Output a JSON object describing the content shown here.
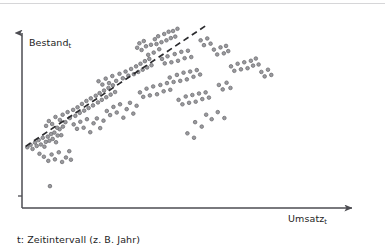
{
  "chart_data": {
    "type": "scatter",
    "title": "",
    "subtitle": "",
    "xlabel": "Umsatz",
    "xlabel_sub": "t",
    "ylabel": "Bestand",
    "ylabel_sub": "t",
    "caption": "t: Zeitintervall (z. B. Jahr)",
    "grid": false,
    "legend": "none",
    "axis_style": "arrow-axes-no-ticks",
    "xlim": [
      0,
      100
    ],
    "ylim": [
      0,
      100
    ],
    "x_tick_labels": [],
    "y_tick_labels": [],
    "marker": {
      "shape": "circle",
      "fill": "#9a9a9e",
      "stroke": "#6e6e72",
      "size_px": 3.6
    },
    "colors": {
      "axis": "#4d4d52",
      "point_fill": "#9a9a9e",
      "point_stroke": "#6e6e72",
      "trendline": "#2b2b2e",
      "text": "#1d1d1d",
      "top_rule": "#d6d6d8",
      "background": "#ffffff"
    },
    "trendline": {
      "type": "linear-dashed",
      "label": "",
      "x_start": 0.6,
      "y_start": 31.0,
      "x_end": 66.5,
      "y_end": 96.5,
      "dash": "6 4",
      "width": 1.7
    },
    "points": [
      [
        1.2,
        30.5
      ],
      [
        2.4,
        31.8
      ],
      [
        3.1,
        29.6
      ],
      [
        4.0,
        33.0
      ],
      [
        4.6,
        31.2
      ],
      [
        5.3,
        34.4
      ],
      [
        6.1,
        32.0
      ],
      [
        6.8,
        35.6
      ],
      [
        7.4,
        30.8
      ],
      [
        7.9,
        33.4
      ],
      [
        8.6,
        36.2
      ],
      [
        9.2,
        34.0
      ],
      [
        9.8,
        37.6
      ],
      [
        10.4,
        35.0
      ],
      [
        11.0,
        38.4
      ],
      [
        11.6,
        33.2
      ],
      [
        12.2,
        36.8
      ],
      [
        12.9,
        40.2
      ],
      [
        13.5,
        37.0
      ],
      [
        14.1,
        41.6
      ],
      [
        8.0,
        42.0
      ],
      [
        9.0,
        44.6
      ],
      [
        10.2,
        43.0
      ],
      [
        11.4,
        46.8
      ],
      [
        12.0,
        41.0
      ],
      [
        13.0,
        45.2
      ],
      [
        14.0,
        48.0
      ],
      [
        15.0,
        44.0
      ],
      [
        15.8,
        49.4
      ],
      [
        16.6,
        46.2
      ],
      [
        5.6,
        27.0
      ],
      [
        7.2,
        25.4
      ],
      [
        8.8,
        23.2
      ],
      [
        10.0,
        26.6
      ],
      [
        11.2,
        24.0
      ],
      [
        12.6,
        27.8
      ],
      [
        13.8,
        22.6
      ],
      [
        15.2,
        25.0
      ],
      [
        16.4,
        28.4
      ],
      [
        17.0,
        23.8
      ],
      [
        9.4,
        9.6
      ],
      [
        17.8,
        50.6
      ],
      [
        18.6,
        47.4
      ],
      [
        19.4,
        52.0
      ],
      [
        20.2,
        49.0
      ],
      [
        21.0,
        53.8
      ],
      [
        21.8,
        50.2
      ],
      [
        22.6,
        55.4
      ],
      [
        23.4,
        51.6
      ],
      [
        24.2,
        56.8
      ],
      [
        25.0,
        53.0
      ],
      [
        18.0,
        42.8
      ],
      [
        19.2,
        40.4
      ],
      [
        20.4,
        44.2
      ],
      [
        21.6,
        41.0
      ],
      [
        22.8,
        45.6
      ],
      [
        24.0,
        38.6
      ],
      [
        25.2,
        43.4
      ],
      [
        26.4,
        46.0
      ],
      [
        27.6,
        40.8
      ],
      [
        28.8,
        44.8
      ],
      [
        26.0,
        58.2
      ],
      [
        26.8,
        54.6
      ],
      [
        27.4,
        59.6
      ],
      [
        28.2,
        56.0
      ],
      [
        29.0,
        61.0
      ],
      [
        29.8,
        57.4
      ],
      [
        30.6,
        62.4
      ],
      [
        31.4,
        58.8
      ],
      [
        32.2,
        63.8
      ],
      [
        33.0,
        60.2
      ],
      [
        27.0,
        66.0
      ],
      [
        28.4,
        64.2
      ],
      [
        29.6,
        67.4
      ],
      [
        30.8,
        65.0
      ],
      [
        32.0,
        68.8
      ],
      [
        33.4,
        66.2
      ],
      [
        34.6,
        70.0
      ],
      [
        35.8,
        67.6
      ],
      [
        36.8,
        71.2
      ],
      [
        37.8,
        69.0
      ],
      [
        30.0,
        50.0
      ],
      [
        31.2,
        47.8
      ],
      [
        32.4,
        52.2
      ],
      [
        33.6,
        49.2
      ],
      [
        34.8,
        53.6
      ],
      [
        36.0,
        46.4
      ],
      [
        37.2,
        51.0
      ],
      [
        38.4,
        54.4
      ],
      [
        39.6,
        48.6
      ],
      [
        40.8,
        52.8
      ],
      [
        38.8,
        72.6
      ],
      [
        39.8,
        69.8
      ],
      [
        40.6,
        74.0
      ],
      [
        41.4,
        71.0
      ],
      [
        42.2,
        75.4
      ],
      [
        43.0,
        72.2
      ],
      [
        43.8,
        76.8
      ],
      [
        44.6,
        73.4
      ],
      [
        45.4,
        78.0
      ],
      [
        46.2,
        74.6
      ],
      [
        41.0,
        84.0
      ],
      [
        41.8,
        86.4
      ],
      [
        42.6,
        82.8
      ],
      [
        43.4,
        87.6
      ],
      [
        44.2,
        84.8
      ],
      [
        45.0,
        80.2
      ],
      [
        46.0,
        85.6
      ],
      [
        47.0,
        81.4
      ],
      [
        48.0,
        86.0
      ],
      [
        49.0,
        83.2
      ],
      [
        42.0,
        60.0
      ],
      [
        43.2,
        57.6
      ],
      [
        44.4,
        62.0
      ],
      [
        45.6,
        58.4
      ],
      [
        46.8,
        63.2
      ],
      [
        48.2,
        59.0
      ],
      [
        49.4,
        64.0
      ],
      [
        50.6,
        60.6
      ],
      [
        51.8,
        65.0
      ],
      [
        53.0,
        61.4
      ],
      [
        47.4,
        88.6
      ],
      [
        48.6,
        90.2
      ],
      [
        49.8,
        87.0
      ],
      [
        50.8,
        91.4
      ],
      [
        51.6,
        88.0
      ],
      [
        52.4,
        92.6
      ],
      [
        53.2,
        89.2
      ],
      [
        54.0,
        93.0
      ],
      [
        54.8,
        90.0
      ],
      [
        55.6,
        94.2
      ],
      [
        50.0,
        78.0
      ],
      [
        51.0,
        75.6
      ],
      [
        52.0,
        79.4
      ],
      [
        53.4,
        76.2
      ],
      [
        54.6,
        80.6
      ],
      [
        55.8,
        77.0
      ],
      [
        57.0,
        81.8
      ],
      [
        58.2,
        78.4
      ],
      [
        59.4,
        82.4
      ],
      [
        60.6,
        79.0
      ],
      [
        52.8,
        68.0
      ],
      [
        54.2,
        65.6
      ],
      [
        55.4,
        69.4
      ],
      [
        56.6,
        66.2
      ],
      [
        57.8,
        70.6
      ],
      [
        59.0,
        67.0
      ],
      [
        60.2,
        71.2
      ],
      [
        61.4,
        68.4
      ],
      [
        62.6,
        72.0
      ],
      [
        63.8,
        69.6
      ],
      [
        56.0,
        56.0
      ],
      [
        57.4,
        53.6
      ],
      [
        58.6,
        57.8
      ],
      [
        59.8,
        54.4
      ],
      [
        61.0,
        58.6
      ],
      [
        62.2,
        55.0
      ],
      [
        63.4,
        59.4
      ],
      [
        64.6,
        56.4
      ],
      [
        65.8,
        60.0
      ],
      [
        67.0,
        57.2
      ],
      [
        64.0,
        88.0
      ],
      [
        65.2,
        85.4
      ],
      [
        66.4,
        89.0
      ],
      [
        67.6,
        86.2
      ],
      [
        68.8,
        83.0
      ],
      [
        70.0,
        80.4
      ],
      [
        71.2,
        84.2
      ],
      [
        72.4,
        81.0
      ],
      [
        73.2,
        85.0
      ],
      [
        74.0,
        82.2
      ],
      [
        75.0,
        74.0
      ],
      [
        76.2,
        71.6
      ],
      [
        77.4,
        75.4
      ],
      [
        78.6,
        72.4
      ],
      [
        79.8,
        76.2
      ],
      [
        81.0,
        73.0
      ],
      [
        82.2,
        77.0
      ],
      [
        83.0,
        74.4
      ],
      [
        84.0,
        78.2
      ],
      [
        85.0,
        75.0
      ],
      [
        86.0,
        71.0
      ],
      [
        87.2,
        68.6
      ],
      [
        88.4,
        72.2
      ],
      [
        89.6,
        69.4
      ],
      [
        70.6,
        64.0
      ],
      [
        72.0,
        61.6
      ],
      [
        73.4,
        65.2
      ],
      [
        74.8,
        62.4
      ],
      [
        66.0,
        48.0
      ],
      [
        68.0,
        45.6
      ],
      [
        70.2,
        49.4
      ],
      [
        72.6,
        46.2
      ],
      [
        62.0,
        44.0
      ],
      [
        64.4,
        41.6
      ],
      [
        59.2,
        38.0
      ],
      [
        61.6,
        35.6
      ]
    ],
    "n_points": 188
  },
  "figure": {
    "axis_arrow": "arrowhead",
    "y_tick_mark": "small-tick-near-origin"
  }
}
